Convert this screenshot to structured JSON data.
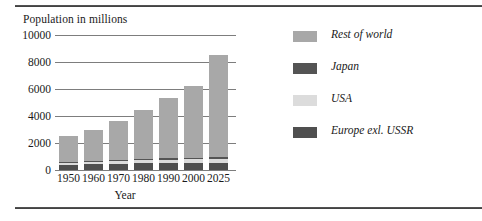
{
  "chart_data": {
    "type": "bar",
    "stacked": true,
    "title": "Population in millions",
    "xlabel": "Year",
    "ylabel": "Population in millions",
    "categories": [
      "1950",
      "1960",
      "1970",
      "1980",
      "1990",
      "2000",
      "2025"
    ],
    "series": [
      {
        "name": "Europe exl. USSR",
        "color": "#4f4f4f",
        "values": [
          390,
          425,
          460,
          485,
          500,
          510,
          515
        ]
      },
      {
        "name": "USA",
        "color": "#dcdcdc",
        "values": [
          155,
          185,
          205,
          230,
          250,
          280,
          330
        ]
      },
      {
        "name": "Japan",
        "color": "#545454",
        "values": [
          85,
          95,
          105,
          117,
          125,
          128,
          122
        ]
      },
      {
        "name": "Rest of world",
        "color": "#a8a8a8",
        "values": [
          1870,
          2295,
          2830,
          3618,
          4425,
          5282,
          7533
        ]
      }
    ],
    "totals": [
      2500,
      3000,
      3600,
      4450,
      5300,
      6200,
      8500
    ],
    "yticks": [
      "0",
      "2000",
      "4000",
      "6000",
      "8000",
      "10000"
    ],
    "ylim": [
      0,
      10000
    ],
    "grid": true,
    "legend_position": "right",
    "legend": [
      {
        "label": "Rest of world",
        "color": "#a8a8a8"
      },
      {
        "label": "Japan",
        "color": "#545454"
      },
      {
        "label": "USA",
        "color": "#dcdcdc"
      },
      {
        "label": "Europe exl. USSR",
        "color": "#4f4f4f"
      }
    ]
  }
}
